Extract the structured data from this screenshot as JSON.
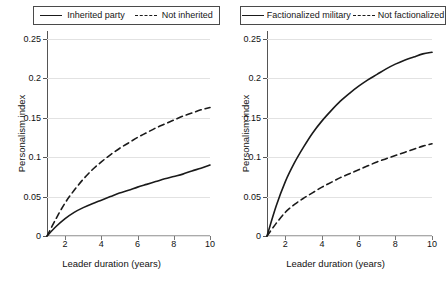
{
  "chart_data": [
    {
      "type": "line",
      "panel": "left",
      "title": "",
      "xlabel": "Leader duration (years)",
      "ylabel": "Personalism index",
      "xlim": [
        1,
        10
      ],
      "ylim": [
        0,
        0.26
      ],
      "grid": true,
      "legend_position": "top",
      "xticks": [
        2,
        4,
        6,
        8,
        10
      ],
      "xtick_labels": [
        "2",
        "4",
        "6",
        "8",
        "10"
      ],
      "yticks": [
        0,
        0.05,
        0.1,
        0.15,
        0.2,
        0.25
      ],
      "ytick_labels": [
        "0",
        "0.05",
        "0.1",
        "0.15",
        "0.2",
        "0.25"
      ],
      "x": [
        1,
        1.5,
        2,
        2.5,
        3,
        3.5,
        4,
        4.5,
        5,
        5.5,
        6,
        6.5,
        7,
        7.5,
        8,
        8.5,
        9,
        9.5,
        10
      ],
      "series": [
        {
          "name": "Inherited party",
          "style": "solid",
          "color": "#1a1a1a",
          "values": [
            0,
            0.012,
            0.022,
            0.03,
            0.036,
            0.041,
            0.0455,
            0.05,
            0.0545,
            0.058,
            0.062,
            0.0655,
            0.069,
            0.0725,
            0.0755,
            0.0785,
            0.0825,
            0.086,
            0.09
          ]
        },
        {
          "name": "Not inherited",
          "style": "dashed",
          "color": "#1a1a1a",
          "values": [
            0,
            0.022,
            0.042,
            0.058,
            0.072,
            0.084,
            0.094,
            0.103,
            0.111,
            0.118,
            0.125,
            0.131,
            0.137,
            0.142,
            0.147,
            0.152,
            0.156,
            0.16,
            0.163
          ]
        }
      ]
    },
    {
      "type": "line",
      "panel": "right",
      "title": "",
      "xlabel": "Leader duration (years)",
      "ylabel": "Personalism index",
      "xlim": [
        1,
        10
      ],
      "ylim": [
        0,
        0.26
      ],
      "grid": true,
      "legend_position": "top",
      "xticks": [
        2,
        4,
        6,
        8,
        10
      ],
      "xtick_labels": [
        "2",
        "4",
        "6",
        "8",
        "10"
      ],
      "yticks": [
        0,
        0.05,
        0.1,
        0.15,
        0.2,
        0.25
      ],
      "ytick_labels": [
        "0",
        "0.05",
        "0.1",
        "0.15",
        "0.2",
        "0.25"
      ],
      "x": [
        1,
        1.5,
        2,
        2.5,
        3,
        3.5,
        4,
        4.5,
        5,
        5.5,
        6,
        6.5,
        7,
        7.5,
        8,
        8.5,
        9,
        9.5,
        10
      ],
      "series": [
        {
          "name": "Factionalized military",
          "style": "solid",
          "color": "#1a1a1a",
          "values": [
            0,
            0.038,
            0.069,
            0.093,
            0.113,
            0.131,
            0.146,
            0.159,
            0.171,
            0.181,
            0.19,
            0.198,
            0.205,
            0.212,
            0.218,
            0.223,
            0.227,
            0.231,
            0.233
          ]
        },
        {
          "name": "Not factionalized",
          "style": "dashed",
          "color": "#1a1a1a",
          "values": [
            0,
            0.016,
            0.03,
            0.04,
            0.048,
            0.055,
            0.062,
            0.068,
            0.074,
            0.079,
            0.084,
            0.089,
            0.094,
            0.098,
            0.102,
            0.106,
            0.11,
            0.114,
            0.117
          ]
        }
      ]
    }
  ],
  "left_panel": {
    "legend": {
      "entries": [
        {
          "label": "Inherited party",
          "style": "solid"
        },
        {
          "label": "Not inherited",
          "style": "dashed"
        }
      ]
    },
    "ylabel": "Personalism index",
    "xlabel": "Leader duration (years)",
    "ytick_labels": [
      "0.25",
      "0.2",
      "0.15",
      "0.1",
      "0.05",
      "0"
    ],
    "xtick_labels": [
      "2",
      "4",
      "6",
      "8",
      "10"
    ]
  },
  "right_panel": {
    "legend": {
      "entries": [
        {
          "label": "Factionalized military",
          "style": "solid"
        },
        {
          "label": "Not factionalized",
          "style": "dashed"
        }
      ]
    },
    "ylabel": "Personalism index",
    "xlabel": "Leader duration (years)",
    "ytick_labels": [
      "0.25",
      "0.2",
      "0.15",
      "0.1",
      "0.05",
      "0"
    ],
    "xtick_labels": [
      "2",
      "4",
      "6",
      "8",
      "10"
    ]
  }
}
